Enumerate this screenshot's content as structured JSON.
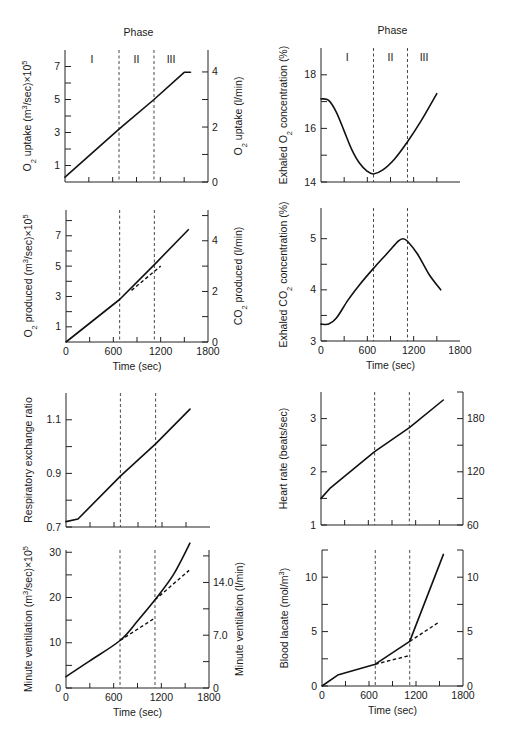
{
  "phase_label": "Phase",
  "phase_names": [
    "I",
    "II",
    "III"
  ],
  "phase_boundaries_sec": [
    680,
    1120
  ],
  "x_axis": {
    "label": "Time (sec)",
    "ticks": [
      0,
      600,
      1200,
      1800
    ],
    "minor_step": 300,
    "range": [
      0,
      1800
    ]
  },
  "chart_data": [
    {
      "id": "o2-uptake",
      "type": "line",
      "title": "",
      "show_phase": true,
      "show_xlabel": false,
      "ylabel": "O2 uptake (m3/sec)×10^5",
      "ylabel_right": "O2 uptake (l/min)",
      "ylim": [
        0,
        8
      ],
      "yticks_labeled": [
        1,
        3,
        5,
        7
      ],
      "yticks_minor": [
        2,
        4,
        6
      ],
      "right_ticks": [
        {
          "v": 0,
          "label": "0"
        },
        {
          "v": 3.33,
          "label": "2"
        },
        {
          "v": 6.67,
          "label": "4"
        }
      ],
      "right_minor": [
        1.67,
        5.0
      ],
      "series": [
        {
          "name": "O2 uptake",
          "style": "solid",
          "x": [
            0,
            680,
            1120,
            1500,
            1580
          ],
          "y": [
            0.3,
            3.2,
            5.0,
            6.65,
            6.65
          ]
        }
      ]
    },
    {
      "id": "exhaled-o2",
      "type": "line",
      "show_phase": true,
      "show_xlabel": false,
      "ylabel": "Exhaled O2 concentration (%)",
      "ylim": [
        14,
        19
      ],
      "yticks_labeled": [
        14,
        16,
        18
      ],
      "yticks_minor": [
        15,
        17
      ],
      "series": [
        {
          "name": "Exhaled O2",
          "style": "solid",
          "x": [
            0,
            100,
            200,
            300,
            400,
            500,
            600,
            680,
            800,
            950,
            1120,
            1300,
            1500
          ],
          "y": [
            17.1,
            17.05,
            16.6,
            15.9,
            15.2,
            14.7,
            14.4,
            14.3,
            14.45,
            14.85,
            15.5,
            16.3,
            17.3
          ]
        }
      ]
    },
    {
      "id": "co2-produced",
      "type": "line",
      "show_phase": false,
      "show_xlabel": true,
      "ylabel": "O2 produced (m3/sec)×10^5",
      "ylabel_right": "CO2 produced (l/min)",
      "ylim": [
        0,
        8.5
      ],
      "yticks_labeled": [
        1,
        3,
        5,
        7
      ],
      "yticks_minor": [
        2,
        4,
        6,
        8
      ],
      "right_ticks": [
        {
          "v": 0,
          "label": "0"
        },
        {
          "v": 3.33,
          "label": "2"
        },
        {
          "v": 6.67,
          "label": "4"
        }
      ],
      "right_minor": [
        1.67,
        5.0,
        8.33
      ],
      "series": [
        {
          "name": "CO2 produced",
          "style": "solid",
          "x": [
            0,
            680,
            1120,
            1550
          ],
          "y": [
            0,
            2.8,
            5.1,
            7.4
          ]
        },
        {
          "name": "extrapolation",
          "style": "dashed",
          "x": [
            830,
            1200
          ],
          "y": [
            3.4,
            5.0
          ]
        }
      ]
    },
    {
      "id": "exhaled-co2",
      "type": "line",
      "show_phase": false,
      "show_xlabel": true,
      "ylabel": "Exhaled CO2 concentration (%)",
      "ylim": [
        3,
        5.6
      ],
      "yticks_labeled": [
        3,
        4,
        5
      ],
      "yticks_minor": [
        3.5,
        4.5
      ],
      "series": [
        {
          "name": "Exhaled CO2",
          "style": "solid",
          "x": [
            0,
            100,
            200,
            350,
            500,
            680,
            850,
            1000,
            1060,
            1120,
            1250,
            1400,
            1550
          ],
          "y": [
            3.33,
            3.33,
            3.45,
            3.8,
            4.1,
            4.42,
            4.7,
            4.95,
            5.0,
            4.95,
            4.7,
            4.3,
            4.0
          ]
        }
      ]
    },
    {
      "id": "rer",
      "type": "line",
      "show_phase": false,
      "show_xlabel": false,
      "ylabel": "Respiratory exchange ratio",
      "ylim": [
        0.7,
        1.2
      ],
      "yticks_labeled": [
        0.7,
        0.9,
        1.1
      ],
      "yticks_minor": [
        0.8,
        1.0
      ],
      "series": [
        {
          "name": "RER",
          "style": "solid",
          "x": [
            0,
            150,
            680,
            1120,
            1550
          ],
          "y": [
            0.72,
            0.73,
            0.89,
            1.01,
            1.14
          ]
        }
      ]
    },
    {
      "id": "heart-rate",
      "type": "line",
      "show_phase": false,
      "show_xlabel": false,
      "ylabel": "Heart rate (beats/sec)",
      "ylim": [
        1,
        3.5
      ],
      "yticks_labeled": [
        1,
        2,
        3
      ],
      "yticks_minor": [
        1.5,
        2.5
      ],
      "right_ticks": [
        {
          "v": 1,
          "label": "60"
        },
        {
          "v": 2,
          "label": "120"
        },
        {
          "v": 3,
          "label": "180"
        }
      ],
      "right_minor": [
        1.5,
        2.5,
        3.5
      ],
      "series": [
        {
          "name": "Heart rate",
          "style": "solid",
          "x": [
            0,
            120,
            680,
            1120,
            1550
          ],
          "y": [
            1.5,
            1.7,
            2.38,
            2.83,
            3.35
          ]
        }
      ]
    },
    {
      "id": "minute-ventilation",
      "type": "line",
      "show_phase": false,
      "show_xlabel": true,
      "ylabel": "Minute ventilation (m3/sec)×10^5",
      "ylabel_right": "Minute ventilation (l/min)",
      "ylim": [
        0,
        30.5
      ],
      "yticks_labeled": [
        0,
        10,
        20,
        30
      ],
      "yticks_minor": [
        5,
        15,
        25
      ],
      "right_ticks": [
        {
          "v": 0,
          "label": "0"
        },
        {
          "v": 11.67,
          "label": "7.0"
        },
        {
          "v": 23.33,
          "label": "14.0"
        }
      ],
      "right_minor": [
        5.83,
        17.5,
        29.2
      ],
      "series": [
        {
          "name": "Minute ventilation",
          "style": "solid",
          "x": [
            0,
            300,
            680,
            900,
            1120,
            1350,
            1560
          ],
          "y": [
            2.5,
            6.0,
            10.5,
            14.8,
            19.5,
            25.0,
            32.0
          ]
        },
        {
          "name": "extrapolation 1",
          "style": "dashed",
          "x": [
            680,
            1120
          ],
          "y": [
            10.5,
            15.5
          ]
        },
        {
          "name": "extrapolation 2",
          "style": "dashed",
          "x": [
            1120,
            1550
          ],
          "y": [
            19.5,
            26.0
          ]
        }
      ]
    },
    {
      "id": "blood-lactate",
      "type": "line",
      "show_phase": false,
      "show_xlabel": true,
      "ylabel": "Blood lacate (mol/m3)",
      "ylim": [
        0,
        12.5
      ],
      "yticks_labeled": [
        0,
        5,
        10
      ],
      "yticks_minor": [
        2.5,
        7.5,
        12.5
      ],
      "right_ticks": [
        {
          "v": 0,
          "label": "0"
        },
        {
          "v": 5,
          "label": "5"
        },
        {
          "v": 10,
          "label": "10"
        }
      ],
      "right_minor": [
        2.5,
        7.5,
        12.5
      ],
      "series": [
        {
          "name": "Blood lactate",
          "style": "solid",
          "x": [
            0,
            200,
            680,
            1120,
            1550
          ],
          "y": [
            0,
            1.0,
            2.0,
            4.1,
            12.1
          ]
        },
        {
          "name": "extrapolation 1",
          "style": "dashed",
          "x": [
            680,
            1120
          ],
          "y": [
            2.0,
            2.8
          ]
        },
        {
          "name": "extrapolation 2",
          "style": "dashed",
          "x": [
            1120,
            1500
          ],
          "y": [
            4.1,
            5.9
          ]
        }
      ]
    }
  ],
  "layout": {
    "panels": [
      {
        "id": "o2-uptake",
        "x0": 65,
        "x1": 208,
        "yTop": 50,
        "yBot": 182,
        "yAtLim": [
          182,
          50
        ]
      },
      {
        "id": "exhaled-o2",
        "x0": 321,
        "x1": 460,
        "yTop": 48,
        "yBot": 182,
        "yAtLim": [
          182,
          48
        ]
      },
      {
        "id": "co2-produced",
        "x0": 66,
        "x1": 208,
        "yTop": 210,
        "yBot": 342,
        "yAtLim": [
          342,
          213
        ]
      },
      {
        "id": "exhaled-co2",
        "x0": 321,
        "x1": 460,
        "yTop": 208,
        "yBot": 341,
        "yAtLim": [
          341,
          208
        ]
      },
      {
        "id": "rer",
        "x0": 66,
        "x1": 210,
        "yTop": 393,
        "yBot": 527,
        "yAtLim": [
          527,
          393
        ]
      },
      {
        "id": "heart-rate",
        "x0": 321,
        "x1": 463,
        "yTop": 392,
        "yBot": 525,
        "yAtLim": [
          525,
          392
        ]
      },
      {
        "id": "minute-ventilation",
        "x0": 66,
        "x1": 209,
        "yTop": 550,
        "yBot": 688,
        "yAtLim": [
          688,
          550
        ]
      },
      {
        "id": "blood-lactate",
        "x0": 322,
        "x1": 463,
        "yTop": 550,
        "yBot": 686,
        "yAtLim": [
          686,
          550
        ]
      }
    ]
  }
}
